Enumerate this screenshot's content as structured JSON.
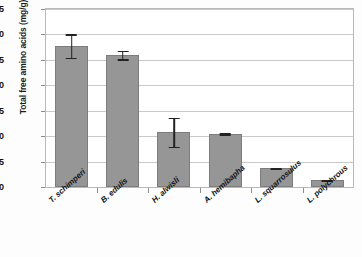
{
  "chart_data": {
    "type": "bar",
    "title": "",
    "xlabel": "",
    "ylabel": "Total free amino acids (mg/g)",
    "ylim": [
      0,
      35
    ],
    "ytick_step": 5,
    "yticks": [
      "0",
      "5",
      "10",
      "15",
      "20",
      "25",
      "30",
      "35"
    ],
    "grid": true,
    "legend": "none",
    "categories": [
      "T. schimperi",
      "B. edulis",
      "H. alwisli",
      "A. hemibapha",
      "L. squarrosulus",
      "L. polychrous"
    ],
    "values": [
      27.8,
      26.0,
      10.8,
      10.5,
      3.7,
      1.3
    ],
    "errors": [
      2.5,
      1.0,
      3.0,
      0.3,
      0.25,
      0.2
    ],
    "series": [
      {
        "name": "Total free amino acids",
        "values": [
          27.8,
          26.0,
          10.8,
          10.5,
          3.7,
          1.3
        ],
        "errors": [
          2.5,
          1.0,
          3.0,
          0.3,
          0.25,
          0.2
        ]
      }
    ],
    "colors": {
      "bar_fill": "#969696",
      "bar_border": "#7d7d7d",
      "gridline": "#c9c9c9",
      "axis": "#b9b9b9",
      "text": "#151515",
      "error_bar": "#222222"
    }
  }
}
